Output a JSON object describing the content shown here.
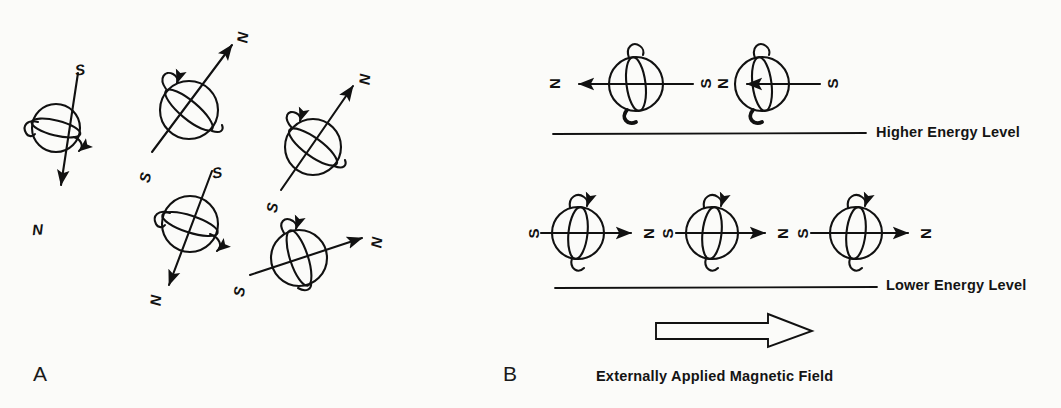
{
  "figure": {
    "background_color": "#fbfbf9",
    "ink_color": "#111111",
    "panels": [
      {
        "id": "A",
        "label": "A"
      },
      {
        "id": "B",
        "label": "B"
      }
    ]
  },
  "panel_a": {
    "label": "A",
    "description_spins": [
      {
        "index": 1,
        "cx": 56,
        "cy": 128,
        "r": 24,
        "axis_angle_deg": -75,
        "north_label": "N",
        "south_label": "S",
        "north_at": "bottom-left",
        "south_at": "top-right"
      },
      {
        "index": 2,
        "cx": 189,
        "cy": 110,
        "r": 29,
        "axis_angle_deg": -42,
        "north_label": "N",
        "south_label": "S",
        "north_at": "top-right",
        "south_at": "bottom-left"
      },
      {
        "index": 3,
        "cx": 313,
        "cy": 147,
        "r": 28,
        "axis_angle_deg": -48,
        "north_label": "N",
        "south_label": "S",
        "north_at": "top-right",
        "south_at": "bottom-left"
      },
      {
        "index": 4,
        "cx": 190,
        "cy": 224,
        "r": 28,
        "axis_angle_deg": -71,
        "north_label": "N",
        "south_label": "S",
        "north_at": "bottom-left",
        "south_at": "top-right"
      },
      {
        "index": 5,
        "cx": 299,
        "cy": 258,
        "r": 28,
        "axis_angle_deg": -18,
        "north_label": "N",
        "south_label": "S",
        "north_at": "right",
        "south_at": "left"
      }
    ],
    "poles": [
      {
        "text": "S",
        "x": 75,
        "y": 62,
        "rot": 0
      },
      {
        "text": "N",
        "x": 32,
        "y": 222,
        "rot": 0
      },
      {
        "text": "N",
        "x": 237,
        "y": 30,
        "rot": 0
      },
      {
        "text": "S",
        "x": 140,
        "y": 170,
        "rot": 0
      },
      {
        "text": "N",
        "x": 359,
        "y": 72,
        "rot": 0
      },
      {
        "text": "S",
        "x": 267,
        "y": 200,
        "rot": 0
      },
      {
        "text": "S",
        "x": 212,
        "y": 165,
        "rot": 0
      },
      {
        "text": "N",
        "x": 150,
        "y": 293,
        "rot": 0
      },
      {
        "text": "N",
        "x": 371,
        "y": 235,
        "rot": 0
      },
      {
        "text": "S",
        "x": 234,
        "y": 284,
        "rot": 0
      }
    ]
  },
  "panel_b": {
    "label": "B",
    "higher_energy_label": "Higher Energy Level",
    "lower_energy_label": "Lower Energy Level",
    "field_caption": "Externally Applied Magnetic Field",
    "higher_row": {
      "energy_line": {
        "x1": 553,
        "y1": 134,
        "x2": 866,
        "y2": 133
      },
      "spins": [
        {
          "index": 1,
          "cx": 636,
          "cy": 84,
          "r": 27,
          "direction": "left",
          "north_label": "N",
          "south_label": "S"
        },
        {
          "index": 2,
          "cx": 762,
          "cy": 84,
          "r": 27,
          "direction": "left",
          "north_label": "N",
          "south_label": "S"
        }
      ],
      "poles": [
        {
          "text": "N",
          "x": 549,
          "y": 76,
          "rot": -90
        },
        {
          "text": "S",
          "x": 700,
          "y": 76,
          "rot": -90
        },
        {
          "text": "N",
          "x": 717,
          "y": 76,
          "rot": -90
        },
        {
          "text": "S",
          "x": 827,
          "y": 76,
          "rot": -90
        }
      ]
    },
    "lower_row": {
      "energy_line": {
        "x1": 555,
        "y1": 288,
        "x2": 877,
        "y2": 287
      },
      "spins": [
        {
          "index": 1,
          "cx": 578,
          "cy": 233,
          "r": 26,
          "direction": "right",
          "north_label": "N",
          "south_label": "S"
        },
        {
          "index": 2,
          "cx": 712,
          "cy": 233,
          "r": 26,
          "direction": "right",
          "north_label": "N",
          "south_label": "S"
        },
        {
          "index": 3,
          "cx": 856,
          "cy": 233,
          "r": 26,
          "direction": "right",
          "north_label": "N",
          "south_label": "S"
        }
      ],
      "poles": [
        {
          "text": "S",
          "x": 528,
          "y": 226,
          "rot": -90
        },
        {
          "text": "N",
          "x": 643,
          "y": 226,
          "rot": -90
        },
        {
          "text": "S",
          "x": 662,
          "y": 226,
          "rot": -90
        },
        {
          "text": "N",
          "x": 777,
          "y": 226,
          "rot": -90
        },
        {
          "text": "S",
          "x": 797,
          "y": 226,
          "rot": -90
        },
        {
          "text": "N",
          "x": 920,
          "y": 226,
          "rot": -90
        }
      ]
    },
    "field_arrow": {
      "x_start": 655,
      "x_end": 812,
      "y": 330,
      "direction": "right"
    }
  }
}
